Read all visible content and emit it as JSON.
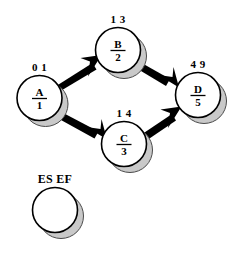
{
  "diagram": {
    "type": "activity-on-node-network",
    "legend": {
      "label": "ES EF",
      "node_id": "",
      "duration": ""
    },
    "nodes": [
      {
        "key": "A",
        "id_label": "A",
        "duration": "1",
        "times_label": "0 1",
        "es": "0",
        "ef": "1",
        "cx": 39.5,
        "cy": 98,
        "r": 22.5,
        "times_x": 39.5,
        "times_y": 71
      },
      {
        "key": "B",
        "id_label": "B",
        "duration": "2",
        "times_label": "1 3",
        "es": "1",
        "ef": "3",
        "cx": 118,
        "cy": 50,
        "r": 22.5,
        "times_x": 118,
        "times_y": 23
      },
      {
        "key": "C",
        "id_label": "C",
        "duration": "3",
        "times_label": "1 4",
        "es": "1",
        "ef": "4",
        "cx": 124,
        "cy": 144,
        "r": 22.5,
        "times_x": 124,
        "times_y": 117
      },
      {
        "key": "D",
        "id_label": "D",
        "duration": "5",
        "times_label": "4 9",
        "es": "4",
        "ef": "9",
        "cx": 198,
        "cy": 95,
        "r": 22.5,
        "times_x": 198,
        "times_y": 68
      }
    ],
    "edges": [
      {
        "from": "A",
        "to": "B"
      },
      {
        "from": "A",
        "to": "C"
      },
      {
        "from": "B",
        "to": "D"
      },
      {
        "from": "C",
        "to": "D"
      }
    ],
    "colors": {
      "stroke": "#000000",
      "fill": "#ffffff",
      "shadow": "#c9c9c9",
      "shadow_stroke": "#4a4a4a",
      "background": "#ffffff"
    }
  }
}
